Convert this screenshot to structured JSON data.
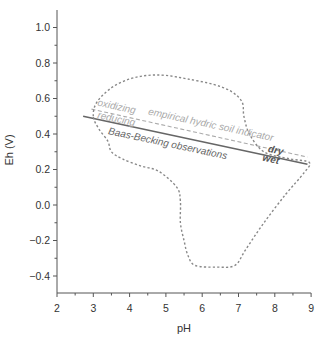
{
  "chart_data": {
    "type": "line",
    "title": "",
    "xlabel": "pH",
    "ylabel": "Eh (V)",
    "xlim": [
      2,
      9
    ],
    "ylim": [
      -0.5,
      1.1
    ],
    "grid": false,
    "legend": null,
    "x_ticks": [
      "2",
      "3",
      "4",
      "5",
      "6",
      "7",
      "8",
      "9"
    ],
    "y_ticks": [
      "1.0",
      "0.8",
      "0.6",
      "0.4",
      "0.2",
      "0.0",
      "−0.2",
      "−0.4"
    ],
    "series": [
      {
        "name": "Baas-Becking observations",
        "style": "solid",
        "color": "#666666",
        "x": [
          2.72,
          8.9
        ],
        "y": [
          0.5,
          0.23
        ]
      },
      {
        "name": "empirical hydric soil indicator",
        "style": "dashed",
        "color": "#aaaaaa",
        "x": [
          2.95,
          8.9
        ],
        "y": [
          0.54,
          0.27
        ]
      },
      {
        "name": "observation envelope",
        "style": "dotted-closed",
        "color": "#888888",
        "x": [
          3.0,
          3.1,
          3.5,
          4.0,
          4.5,
          5.0,
          5.6,
          6.3,
          6.8,
          7.1,
          7.15,
          7.3,
          7.7,
          8.4,
          8.95,
          8.8,
          8.3,
          7.7,
          7.2,
          6.9,
          6.4,
          5.8,
          5.6,
          5.5,
          5.4,
          5.4,
          5.3,
          4.8,
          4.3,
          3.8,
          3.5,
          3.4,
          3.15,
          3.0
        ],
        "y": [
          0.5,
          0.58,
          0.66,
          0.71,
          0.73,
          0.73,
          0.71,
          0.68,
          0.64,
          0.58,
          0.5,
          0.4,
          0.3,
          0.26,
          0.24,
          0.18,
          0.06,
          -0.1,
          -0.25,
          -0.34,
          -0.35,
          -0.34,
          -0.28,
          -0.2,
          -0.1,
          0.02,
          0.1,
          0.19,
          0.22,
          0.26,
          0.3,
          0.36,
          0.43,
          0.5
        ]
      }
    ],
    "annotations": [
      {
        "text": "oxidizing",
        "color": "#aaaaaa",
        "x": 3.1,
        "y": 0.56
      },
      {
        "text": "empirical hydric soil indicator",
        "color": "#aaaaaa",
        "x": 4.5,
        "y": 0.51
      },
      {
        "text": "reducing",
        "color": "#aaaaaa",
        "x": 3.1,
        "y": 0.49
      },
      {
        "text": "Baas-Becking observations",
        "color": "#666666",
        "x": 3.4,
        "y": 0.4
      },
      {
        "text": "dry",
        "color": "#555555",
        "x": 7.8,
        "y": 0.3
      },
      {
        "text": "wet",
        "color": "#555555",
        "x": 7.65,
        "y": 0.25
      }
    ]
  }
}
